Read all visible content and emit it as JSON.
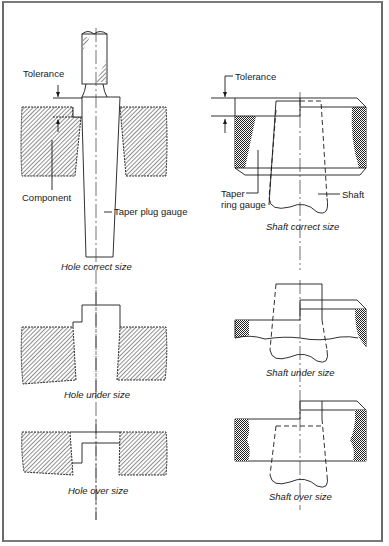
{
  "figure": {
    "panels": {
      "hole_correct": {
        "caption": "Hole correct size",
        "labels": {
          "tolerance": "Tolerance",
          "component": "Component",
          "taper_plug_gauge": "Taper plug gauge"
        }
      },
      "shaft_correct": {
        "caption": "Shaft correct size",
        "labels": {
          "tolerance": "Tolerance",
          "taper_ring_gauge_line1": "Taper",
          "taper_ring_gauge_line2": "ring gauge",
          "shaft": "Shaft"
        }
      },
      "hole_under": {
        "caption": "Hole under size"
      },
      "shaft_under": {
        "caption": "Shaft under size"
      },
      "hole_over": {
        "caption": "Hole over size"
      },
      "shaft_over": {
        "caption": "Shaft over size"
      }
    }
  }
}
